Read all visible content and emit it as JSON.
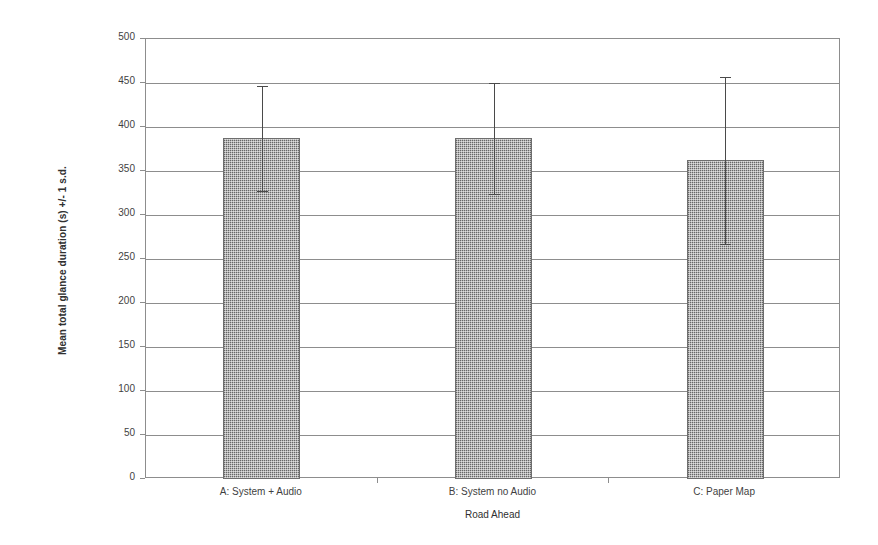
{
  "chart_data": {
    "type": "bar",
    "title": "",
    "xlabel": "Road Ahead",
    "ylabel": "Mean total glance duration (s) +/- 1 s.d.",
    "categories": [
      "A: System + Audio",
      "B: System no Audio",
      "C: Paper Map"
    ],
    "values": [
      387,
      387,
      362
    ],
    "errors_upper": [
      447,
      450,
      457
    ],
    "errors_lower": [
      327,
      324,
      267
    ],
    "error_type": "+/- 1 s.d.",
    "ylim": [
      0,
      500
    ],
    "ytick_step": 50,
    "yticks": [
      0,
      50,
      100,
      150,
      200,
      250,
      300,
      350,
      400,
      450,
      500
    ],
    "ytick_labels": [
      "0",
      "50",
      "100",
      "150",
      "200",
      "250",
      "300",
      "350",
      "400",
      "450",
      "500"
    ],
    "grid": "horizontal",
    "legend": "none",
    "bar_fill_color": "#b4b4b4",
    "bar_edge_color": "#6e6e6e",
    "axis_color": "#8d8d8d",
    "errorbar_color": "#4a4a4a",
    "background_color": "#ffffff"
  }
}
